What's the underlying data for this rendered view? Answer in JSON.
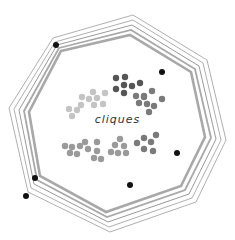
{
  "title": "cliques",
  "colors": {
    "ring_thin": "#9a9a9a",
    "ring_thick": "#a8a8a8",
    "outer_dot": "#111111",
    "cluster_dark": "#555555",
    "cluster_mid": "#7a7a7a",
    "cluster_light": "#c4c4c4",
    "cluster_gray": "#9a9a9a"
  },
  "rings": [
    {
      "points": "53,38 133,15 207,60 226,140 196,202 110,232 28,192 9,108",
      "width": 0.8
    },
    {
      "points": "55,42 133,20 203,63 221,140 192,198 109,227 31,188 14,109",
      "width": 0.8
    },
    {
      "points": "57,45 132,25 199,66 216,139 189,194 108,222 34,184 19,110",
      "width": 1
    },
    {
      "points": "59,48 131,30 195,69 211,138 185,190 107,217 37,180 24,111",
      "width": 1.8
    },
    {
      "points": "61,51 130,35 191,72 205,137 181,186 106,212 40,176 29,112",
      "width": 2.6
    }
  ],
  "outer_dots": [
    {
      "x": 56,
      "y": 45
    },
    {
      "x": 162,
      "y": 72
    },
    {
      "x": 177,
      "y": 153
    },
    {
      "x": 130,
      "y": 185
    },
    {
      "x": 35,
      "y": 178
    },
    {
      "x": 26,
      "y": 196
    }
  ],
  "clusters": [
    {
      "name": "dark",
      "color": "cluster_dark",
      "dots": [
        [
          116,
          78
        ],
        [
          125,
          77
        ],
        [
          124,
          85
        ],
        [
          116,
          89
        ],
        [
          132,
          86
        ],
        [
          140,
          83
        ],
        [
          124,
          93
        ]
      ]
    },
    {
      "name": "mid",
      "color": "cluster_mid",
      "dots": [
        [
          136,
          96
        ],
        [
          144,
          97
        ],
        [
          152,
          91
        ],
        [
          162,
          99
        ],
        [
          139,
          103
        ],
        [
          147,
          104
        ],
        [
          154,
          106
        ],
        [
          149,
          112
        ],
        [
          144,
          96
        ]
      ]
    },
    {
      "name": "light",
      "color": "cluster_light",
      "dots": [
        [
          93,
          92
        ],
        [
          82,
          97
        ],
        [
          89,
          99
        ],
        [
          97,
          98
        ],
        [
          105,
          93
        ],
        [
          81,
          105
        ],
        [
          94,
          105
        ],
        [
          103,
          104
        ],
        [
          69,
          109
        ],
        [
          77,
          110
        ],
        [
          72,
          116
        ]
      ]
    },
    {
      "name": "gray-left",
      "color": "cluster_gray",
      "dots": [
        [
          65,
          146
        ],
        [
          72,
          147
        ],
        [
          80,
          146
        ],
        [
          85,
          142
        ],
        [
          70,
          153
        ],
        [
          77,
          154
        ],
        [
          88,
          149
        ],
        [
          97,
          142
        ],
        [
          97,
          151
        ],
        [
          94,
          158
        ],
        [
          101,
          159
        ]
      ]
    },
    {
      "name": "gray-mid",
      "color": "cluster_gray",
      "dots": [
        [
          120,
          139
        ],
        [
          115,
          145
        ],
        [
          124,
          146
        ],
        [
          111,
          152
        ],
        [
          118,
          153
        ],
        [
          126,
          153
        ]
      ]
    },
    {
      "name": "gray-right",
      "color": "cluster_mid",
      "dots": [
        [
          137,
          143
        ],
        [
          144,
          138
        ],
        [
          151,
          142
        ],
        [
          156,
          135
        ],
        [
          144,
          149
        ],
        [
          153,
          151
        ]
      ]
    }
  ]
}
